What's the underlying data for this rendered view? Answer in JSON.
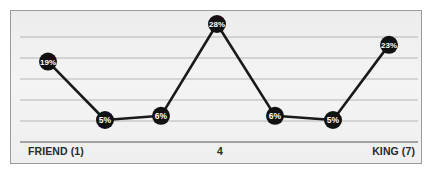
{
  "chart_data": {
    "type": "line",
    "title": "",
    "xlabel": "",
    "ylabel": "",
    "categories": [
      "1",
      "2",
      "3",
      "4",
      "5",
      "6",
      "7"
    ],
    "series": [
      {
        "name": "percentage",
        "values": [
          19,
          5,
          6,
          28,
          6,
          5,
          23
        ]
      }
    ],
    "data_labels": [
      "19%",
      "5%",
      "6%",
      "28%",
      "6%",
      "5%",
      "23%"
    ],
    "x_tick_labels": {
      "left": "FRIEND (1)",
      "middle": "4",
      "right": "KING (7)"
    },
    "grid": true,
    "legend": "none",
    "ylim": [
      0,
      30
    ]
  },
  "colors": {
    "line": "#1a1a1a",
    "marker_fill": "#111111",
    "marker_text": "#ffffff",
    "gridline": "#b5b5b5",
    "baseline": "#555555",
    "frame_border": "#9a9a9a"
  }
}
